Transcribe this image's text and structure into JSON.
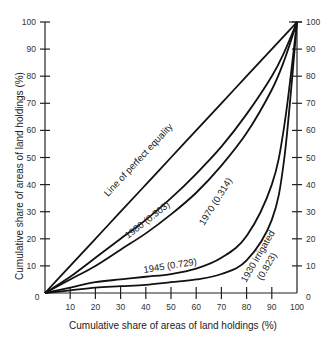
{
  "chart_data": {
    "type": "line",
    "title": "",
    "xlabel": "Cumulative share of areas of land holdings (%)",
    "ylabel": "Cumulative share of areas of land holdings (%)",
    "xlim": [
      0,
      100
    ],
    "ylim": [
      0,
      100
    ],
    "grid": false,
    "legend_position": "inline labels on curves",
    "x_ticks": [
      10,
      20,
      30,
      40,
      50,
      60,
      70,
      80,
      90,
      100
    ],
    "y_ticks_left": [
      0,
      10,
      20,
      30,
      40,
      50,
      60,
      70,
      80,
      90,
      100
    ],
    "y_ticks_right": [
      0,
      10,
      20,
      30,
      40,
      50,
      60,
      70,
      80,
      90,
      100
    ],
    "x": [
      0,
      10,
      20,
      30,
      40,
      50,
      60,
      70,
      80,
      90,
      95,
      100
    ],
    "series": [
      {
        "name": "Line of perfect equality",
        "values": [
          0,
          10,
          20,
          30,
          40,
          50,
          60,
          70,
          80,
          90,
          95,
          100
        ]
      },
      {
        "name": "1980 (0.303)",
        "values": [
          0,
          6,
          13,
          20,
          27,
          35,
          44,
          54,
          66,
          80,
          89,
          100
        ]
      },
      {
        "name": "1970 (0.314)",
        "values": [
          0,
          5,
          10,
          16,
          22,
          29,
          37,
          47,
          59,
          75,
          86,
          100
        ]
      },
      {
        "name": "1945 (0.729)",
        "values": [
          0,
          2,
          4,
          5,
          6,
          7,
          9,
          13,
          21,
          40,
          62,
          100
        ]
      },
      {
        "name": "1930 irrigated (0.823)",
        "values": [
          0,
          1,
          2,
          2.5,
          3,
          4,
          5,
          7,
          12,
          27,
          50,
          100
        ]
      }
    ],
    "annotations": [
      {
        "text": "Line of perfect equality",
        "anchor_x": 30,
        "anchor_y": 48
      },
      {
        "text": "1980 (0.303)",
        "anchor_x": 28,
        "anchor_y": 26
      },
      {
        "text": "1970 (0.314)",
        "anchor_x": 60,
        "anchor_y": 33
      },
      {
        "text": "1945 (0.729)",
        "anchor_x": 38,
        "anchor_y": 9
      },
      {
        "text": "1930 irrigated",
        "anchor_x": 82,
        "anchor_y": 10
      },
      {
        "text": "(0.823)",
        "anchor_x": 86,
        "anchor_y": 8
      }
    ]
  },
  "labels": {
    "zero_left": "0",
    "zero_right": "0",
    "equality": "Line of perfect equality",
    "s1980": "1980 (0.303)",
    "s1970": "1970 (0.314)",
    "s1945": "1945 (0.729)",
    "s1930a": "1930 irrigated",
    "s1930b": "(0.823)"
  }
}
